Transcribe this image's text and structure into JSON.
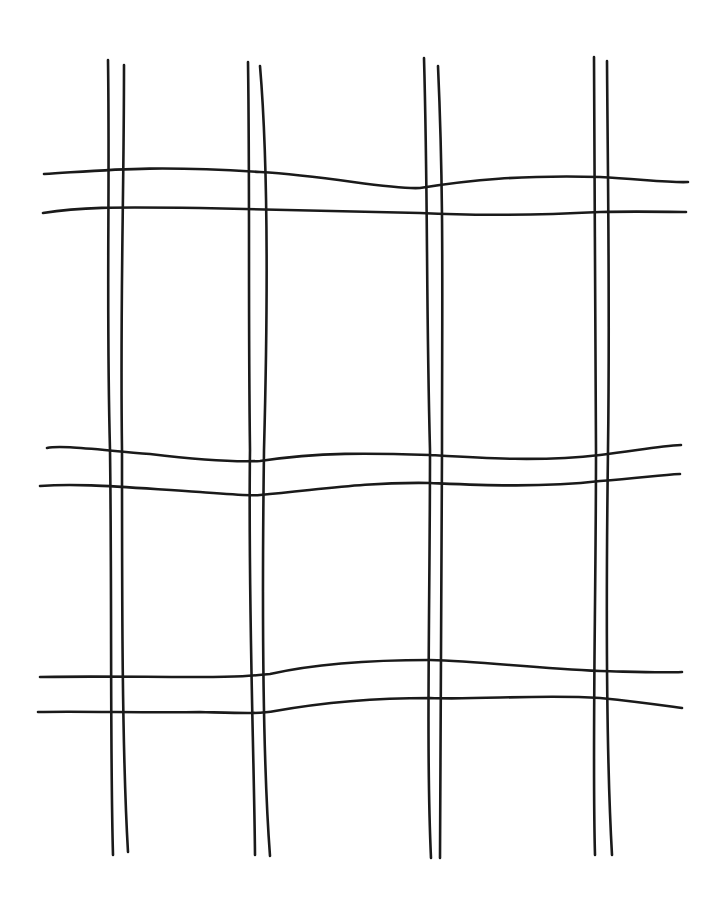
{
  "drawing": {
    "title": "Hand-drawn double-line grid",
    "stroke_color": "#1a1a1a",
    "background": "#ffffff",
    "vertical_lines": [
      "M108,60 C110,200 106,300 110,450 C112,600 110,750 113,855",
      "M124,65 C124,200 120,300 122,450 C122,600 122,750 128,852",
      "M248,62 C250,200 248,300 250,450 C248,600 254,750 255,855",
      "M260,66 C268,160 268,300 264,450 C262,600 262,750 270,856",
      "M424,58 C428,200 426,300 430,450 C430,600 426,750 431,858",
      "M438,66 C444,200 442,300 442,450 C442,600 440,750 440,858",
      "M594,57 C594,200 596,300 596,450 C596,600 592,750 595,855",
      "M607,61 C608,200 610,300 608,450 C606,600 606,750 612,855"
    ],
    "horizontal_lines": [
      "M44,174 C110,170 150,165 260,172 C330,176 390,190 420,188 C470,180 520,175 600,177 C640,179 670,183 688,182",
      "M43,213 C80,207 110,207 200,208 C300,210 360,212 420,213 C480,216 540,215 600,212 C640,211 670,212 686,212",
      "M47,448 C60,445 90,449 150,454 C200,460 240,462 260,461 C320,452 370,453 430,455 C480,458 540,462 600,455 C640,450 660,446 681,445",
      "M40,486 C80,483 120,487 200,492 C240,495 250,496 260,495 C320,490 360,482 430,483 C480,485 540,488 600,481 C640,478 660,475 680,474",
      "M40,677 C80,676 150,677 200,677 C240,677 250,676 270,674 C310,665 360,660 430,660 C480,661 530,668 600,671 C640,672 660,673 682,672",
      "M38,712 C80,711 150,713 200,712 C240,713 260,714 275,711 C320,703 370,698 430,698 C480,700 540,694 600,698 C640,702 660,705 682,708"
    ]
  }
}
